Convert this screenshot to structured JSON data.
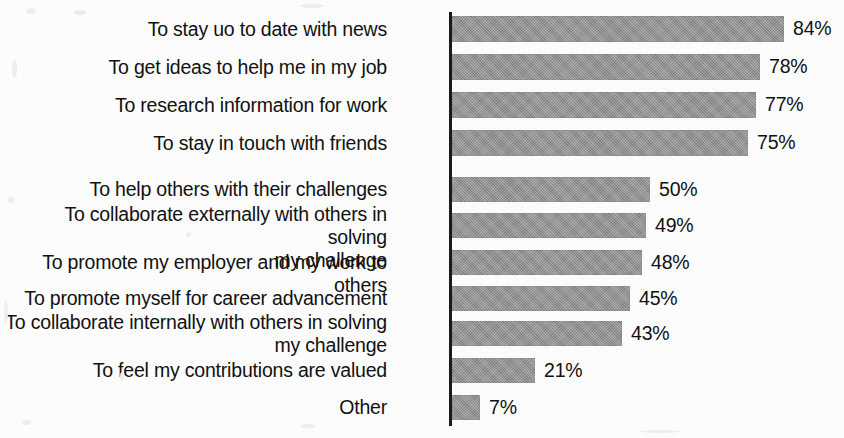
{
  "chart_data": {
    "type": "bar",
    "orientation": "horizontal",
    "title": "",
    "subtitle": "",
    "xlabel": "",
    "ylabel": "",
    "xlim": [
      0,
      100
    ],
    "grid": false,
    "legend": false,
    "value_suffix": "%",
    "bar_color": "#8f8f8f",
    "text_color": "#111111",
    "background_color": "#fcfcfc",
    "axis_color": "#1a1a1a",
    "categories": [
      "To stay uo to date with news",
      "To get ideas to help me in my job",
      "To research information for work",
      "To stay in touch with friends",
      "To help others with their challenges",
      "To collaborate externally with others in solving\nmy challenge",
      "To promote my employer and my work to others",
      "To promote myself for career advancement",
      "To collaborate internally with others in solving\nmy challenge",
      "To feel my contributions are valued",
      "Other"
    ],
    "values": [
      84,
      78,
      77,
      75,
      50,
      49,
      48,
      45,
      43,
      21,
      7
    ],
    "value_labels": [
      "84%",
      "78%",
      "77%",
      "75%",
      "50%",
      "49%",
      "48%",
      "45%",
      "43%",
      "21%",
      "7%"
    ]
  },
  "layout": {
    "axis_x": 449,
    "bar_start_x": 452,
    "px_per_percent": 3.95,
    "rows": [
      {
        "top": 16,
        "height": 26,
        "label_lines": 1
      },
      {
        "top": 54,
        "height": 26,
        "label_lines": 1
      },
      {
        "top": 92,
        "height": 26,
        "label_lines": 1
      },
      {
        "top": 130,
        "height": 26,
        "label_lines": 1
      },
      {
        "top": 177,
        "height": 25,
        "label_lines": 1
      },
      {
        "top": 213,
        "height": 25,
        "label_lines": 2
      },
      {
        "top": 250,
        "height": 25,
        "label_lines": 1
      },
      {
        "top": 286,
        "height": 25,
        "label_lines": 1
      },
      {
        "top": 321,
        "height": 25,
        "label_lines": 2
      },
      {
        "top": 358,
        "height": 25,
        "label_lines": 1
      },
      {
        "top": 395,
        "height": 25,
        "label_lines": 1
      }
    ]
  }
}
